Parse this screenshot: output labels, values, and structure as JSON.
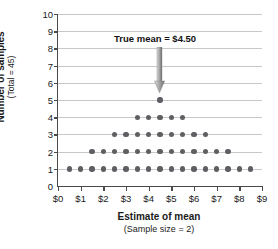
{
  "chart_data": {
    "type": "scatter",
    "title": "",
    "xlabel": "Estimate of mean",
    "xlabel_sub": "(Sample size = 2)",
    "ylabel": "Number of samples",
    "ylabel_sub": "(Total = 45)",
    "xlim": [
      0,
      9
    ],
    "ylim": [
      0,
      10
    ],
    "grid": true,
    "legend": "none",
    "x_tick_labels": [
      "$0",
      "$1",
      "$2",
      "$3",
      "$4",
      "$5",
      "$6",
      "$7",
      "$8",
      "$9"
    ],
    "x_tick_values": [
      0,
      1,
      2,
      3,
      4,
      5,
      6,
      7,
      8,
      9
    ],
    "y_tick_labels": [
      "0",
      "1",
      "2",
      "3",
      "4",
      "5",
      "6",
      "7",
      "8",
      "9",
      "10"
    ],
    "y_tick_values": [
      0,
      1,
      2,
      3,
      4,
      5,
      6,
      7,
      8,
      9,
      10
    ],
    "dot_color": "#5f5f63",
    "grid_color": "#c8c8c8",
    "axis_color": "#4a4a4a",
    "total_samples": 45,
    "stacks": [
      {
        "x": 0.5,
        "count": 1
      },
      {
        "x": 1.0,
        "count": 1
      },
      {
        "x": 1.5,
        "count": 2
      },
      {
        "x": 2.0,
        "count": 2
      },
      {
        "x": 2.5,
        "count": 3
      },
      {
        "x": 3.0,
        "count": 3
      },
      {
        "x": 3.5,
        "count": 4
      },
      {
        "x": 4.0,
        "count": 4
      },
      {
        "x": 4.5,
        "count": 5
      },
      {
        "x": 5.0,
        "count": 4
      },
      {
        "x": 5.5,
        "count": 4
      },
      {
        "x": 6.0,
        "count": 3
      },
      {
        "x": 6.5,
        "count": 3
      },
      {
        "x": 7.0,
        "count": 2
      },
      {
        "x": 7.5,
        "count": 2
      },
      {
        "x": 8.0,
        "count": 1
      },
      {
        "x": 8.5,
        "count": 1
      }
    ],
    "rows": [
      {
        "y": 1,
        "x_values": [
          0.5,
          1.0,
          1.5,
          2.0,
          2.5,
          3.0,
          3.5,
          4.0,
          4.5,
          5.0,
          5.5,
          6.0,
          6.5,
          7.0,
          7.5,
          8.0,
          8.5
        ]
      },
      {
        "y": 2,
        "x_values": [
          1.5,
          2.0,
          2.5,
          3.0,
          3.5,
          4.0,
          4.5,
          5.0,
          5.5,
          6.0,
          6.5,
          7.0,
          7.5
        ]
      },
      {
        "y": 3,
        "x_values": [
          2.5,
          3.0,
          3.5,
          4.0,
          4.5,
          5.0,
          5.5,
          6.0,
          6.5
        ]
      },
      {
        "y": 4,
        "x_values": [
          3.5,
          4.0,
          4.5,
          5.0,
          5.5
        ]
      },
      {
        "y": 5,
        "x_values": [
          4.5
        ]
      }
    ],
    "annotations": [
      {
        "text": "True mean  =  $4.50",
        "x": 4.5,
        "arrow_from_y": 8.1,
        "arrow_to_y": 5.4
      }
    ]
  }
}
